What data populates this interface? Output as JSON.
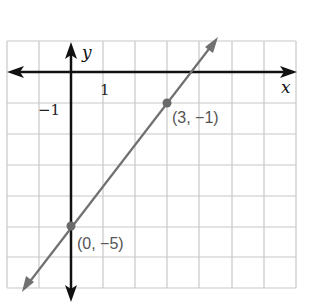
{
  "graph": {
    "x_axis_label": "x",
    "y_axis_label": "y",
    "tick_x_label": "1",
    "tick_y_label": "−1",
    "line": {
      "slope": 1.333,
      "intercept": -5,
      "color": "#707070"
    },
    "points": [
      {
        "x": 0,
        "y": -5,
        "label": "(0, −5)"
      },
      {
        "x": 3,
        "y": -1,
        "label": "(3, −1)"
      }
    ],
    "grid": {
      "x_min": -2,
      "x_max": 7,
      "y_min": -7,
      "y_max": 1,
      "color": "#c8c8c8"
    },
    "axis_color": "#111111"
  }
}
